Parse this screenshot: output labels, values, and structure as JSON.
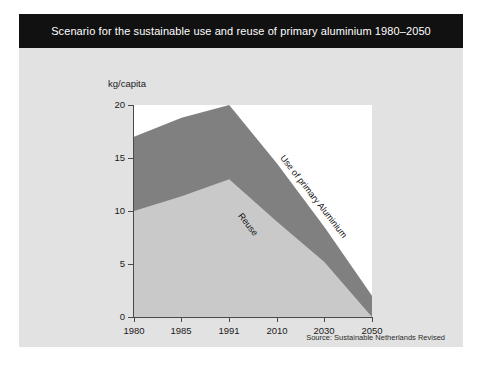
{
  "card": {
    "background_color": "#e2e2e2"
  },
  "title": {
    "text": "Scenario for the sustainable use and reuse of primary aluminium 1980–2050",
    "background_color": "#111111",
    "text_color": "#ffffff"
  },
  "source": {
    "text": "Source: Sustainable Netherlands Revised"
  },
  "chart_data": {
    "type": "area",
    "title": "Scenario for the sustainable use and reuse of primary aluminium 1980–2050",
    "subtitle": "",
    "xlabel": "",
    "ylabel": "kg/capita",
    "categories": [
      "1980",
      "1985",
      "1991",
      "2010",
      "2030",
      "2050"
    ],
    "x_tick_labels": [
      "1980",
      "1985",
      "1991",
      "2010",
      "2030",
      "2050"
    ],
    "y_tick_labels": [
      "0",
      "5",
      "10",
      "15",
      "20"
    ],
    "y_ticks": [
      0,
      5,
      10,
      15,
      20
    ],
    "ylim": [
      0,
      20
    ],
    "grid": false,
    "legend_position": "inline-annotations",
    "stacked": true,
    "series": [
      {
        "name": "Reuse",
        "color": "#c9c9c9",
        "values": [
          10.0,
          11.4,
          13.0,
          9.0,
          5.2,
          0.0
        ],
        "annotation": "Reuse"
      },
      {
        "name": "Use of primary Aluminium",
        "color": "#808080",
        "values": [
          7.0,
          7.4,
          7.0,
          5.5,
          3.3,
          2.0
        ],
        "annotation": "Use of primary Aluminium"
      }
    ],
    "totals": [
      17.0,
      18.8,
      20.0,
      14.5,
      8.5,
      2.0
    ],
    "annotations": [
      {
        "text": "Use of primary Aluminium",
        "rotation_deg": 52
      },
      {
        "text": "Reuse",
        "rotation_deg": 52
      }
    ]
  }
}
